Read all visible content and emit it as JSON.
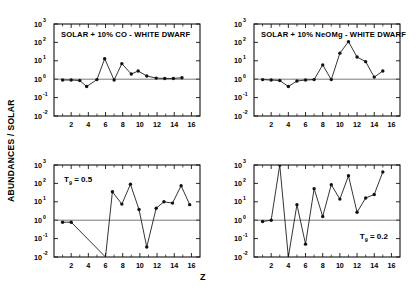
{
  "figure": {
    "ylabel": "ABUNDANCES / SOLAR",
    "xlabel": "Z"
  },
  "axis": {
    "y_ticks": [
      {
        "mantissa": "10",
        "exp": "3"
      },
      {
        "mantissa": "10",
        "exp": "2"
      },
      {
        "mantissa": "10",
        "exp": "1"
      },
      {
        "mantissa": "10",
        "exp": "0"
      },
      {
        "mantissa": "10",
        "exp": "-1"
      },
      {
        "mantissa": "10",
        "exp": "-2"
      }
    ],
    "x_ticks": [
      "2",
      "4",
      "6",
      "8",
      "10",
      "12",
      "14",
      "16"
    ],
    "ylim": [
      -2,
      3
    ],
    "xlim": [
      0,
      17
    ]
  },
  "chart_data": [
    {
      "type": "line",
      "panel": "top-left",
      "title": "SOLAR + 10% CO - WHITE DWARF",
      "annotation": "",
      "xlabel": "Z",
      "ylabel": "ABUNDANCES / SOLAR",
      "xlim": [
        0,
        17
      ],
      "ylim": [
        0.01,
        1000
      ],
      "yscale": "log",
      "grid": false,
      "legend": "none",
      "x": [
        1,
        2,
        3,
        3.8,
        5,
        5.9,
        7,
        7.9,
        9,
        9.8,
        10.8,
        11.9,
        12.9,
        13.9,
        14.9
      ],
      "y": [
        0.9,
        0.9,
        0.85,
        0.4,
        0.95,
        13.0,
        0.9,
        7.0,
        1.9,
        2.8,
        1.5,
        1.15,
        1.1,
        1.1,
        1.2
      ]
    },
    {
      "type": "line",
      "panel": "top-right",
      "title": "SOLAR + 10% NeOMg - WHITE DWARF",
      "annotation": "",
      "xlabel": "Z",
      "ylabel": "ABUNDANCES / SOLAR",
      "xlim": [
        0,
        17
      ],
      "ylim": [
        0.01,
        1000
      ],
      "yscale": "log",
      "grid": false,
      "legend": "none",
      "x": [
        1,
        2,
        3,
        4,
        5,
        6,
        7,
        8,
        9,
        10,
        11,
        12,
        13,
        14,
        15
      ],
      "y": [
        0.95,
        0.9,
        0.85,
        0.4,
        0.8,
        0.9,
        0.95,
        6.0,
        0.95,
        26.0,
        110.0,
        16.0,
        9.0,
        1.3,
        2.8
      ]
    },
    {
      "type": "line",
      "panel": "bottom-left",
      "title": "",
      "annotation": "T₉ = 0.5",
      "xlabel": "Z",
      "ylabel": "ABUNDANCES / SOLAR",
      "xlim": [
        0,
        17
      ],
      "ylim": [
        0.01,
        1000
      ],
      "yscale": "log",
      "grid": false,
      "legend": "none",
      "x": [
        1,
        2,
        6,
        6.8,
        7.9,
        8.9,
        9.9,
        10.8,
        11.9,
        12.8,
        13.8,
        14.8,
        15.8
      ],
      "y": [
        0.78,
        0.78,
        0.01,
        35.0,
        7.5,
        90.0,
        3.8,
        0.035,
        4.5,
        10.0,
        8.5,
        75.0,
        7.0
      ]
    },
    {
      "type": "line",
      "panel": "bottom-right",
      "title": "",
      "annotation": "T₉ = 0.2",
      "xlabel": "Z",
      "ylabel": "ABUNDANCES / SOLAR",
      "xlim": [
        0,
        17
      ],
      "ylim": [
        0.01,
        1000
      ],
      "yscale": "log",
      "grid": false,
      "legend": "none",
      "x": [
        1,
        2,
        3,
        4,
        5,
        6,
        7,
        8,
        9,
        10,
        11,
        12,
        13,
        14,
        15
      ],
      "y": [
        0.85,
        1.0,
        1000.0,
        0.01,
        7.0,
        0.05,
        52.0,
        1.6,
        85.0,
        14.0,
        260.0,
        2.7,
        16.0,
        25.0,
        420.0
      ]
    }
  ]
}
